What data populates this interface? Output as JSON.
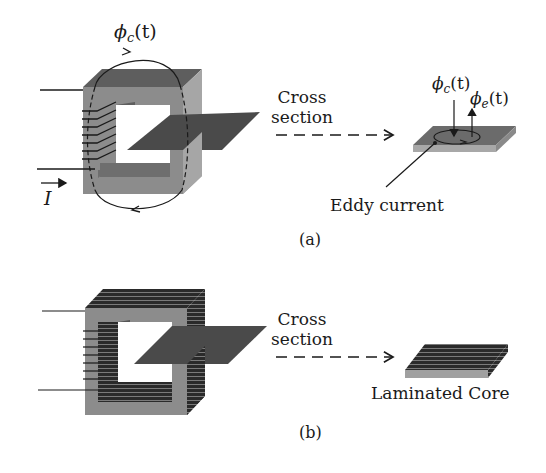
{
  "panel_a": {
    "flux_core_symbol": "ϕ",
    "flux_core_sub": "c",
    "flux_core_arg": "(t)",
    "current_label": "I",
    "arrow_label_line1": "Cross",
    "arrow_label_line2": "section",
    "cross_flux_core_symbol": "ϕ",
    "cross_flux_core_sub": "c",
    "cross_flux_core_arg": "(t)",
    "cross_flux_eddy_symbol": "ϕ",
    "cross_flux_eddy_sub": "e",
    "cross_flux_eddy_arg": "(t)",
    "eddy_label": "Eddy current",
    "caption": "(a)"
  },
  "panel_b": {
    "arrow_label_line1": "Cross",
    "arrow_label_line2": "section",
    "laminated_label": "Laminated Core",
    "caption": "(b)"
  },
  "colors": {
    "core_face": "#8c8c8c",
    "core_top": "#5e5e5e",
    "core_side": "#a6a6a6",
    "plane": "#4a4a4a",
    "lamination_dark": "#2a2a2a",
    "ink": "#1a1a1a"
  }
}
